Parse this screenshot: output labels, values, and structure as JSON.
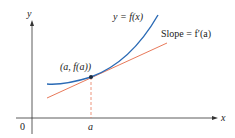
{
  "diagram": {
    "axes": {
      "x_label": "x",
      "y_label": "y",
      "origin_label": "0"
    },
    "curve": {
      "label": "y = f(x)",
      "color": "#2a6ab5"
    },
    "tangent": {
      "label": "Slope = f′(a)",
      "color": "#e8795a"
    },
    "point": {
      "label": "(a, f(a))"
    },
    "tick": {
      "label": "a"
    }
  }
}
